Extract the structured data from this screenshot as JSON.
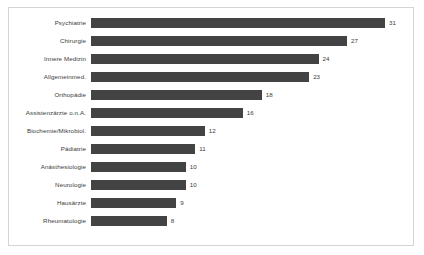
{
  "chart_data": {
    "type": "bar",
    "orientation": "horizontal",
    "title": "",
    "subtitle": "",
    "xlabel": "",
    "ylabel": "",
    "grid": false,
    "legend": false,
    "legend_position": "none",
    "xlim": [
      0,
      31
    ],
    "bar_color": "#434343",
    "text_color": "#3a3a3a",
    "border_color": "#d4d4d4",
    "background_color": "#ffffff",
    "show_value_labels": true,
    "categories": [
      "Psychiatrie",
      "Chirurgie",
      "Innere Medizin",
      "Allgemeinmed.",
      "Orthopädie",
      "Assistenzärzte o.n.A.",
      "Biochemie/Mikrobiol.",
      "Pädiatrie",
      "Anästhesiologie",
      "Neurologie",
      "Hausärzte",
      "Rheumatologie"
    ],
    "values": [
      31,
      27,
      24,
      23,
      18,
      16,
      12,
      11,
      10,
      10,
      9,
      8
    ],
    "value_labels": [
      "31",
      "27",
      "24",
      "23",
      "18",
      "16",
      "12",
      "11",
      "10",
      "10",
      "9",
      "8"
    ]
  }
}
